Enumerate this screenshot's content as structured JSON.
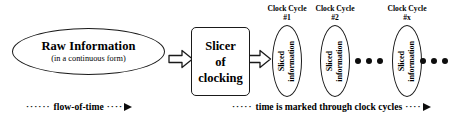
{
  "diagram": {
    "source": {
      "title": "Raw Information",
      "subtitle": "(in a continuous form)"
    },
    "slicer": {
      "line1": "Slicer",
      "line2": "of",
      "line3": "clocking"
    },
    "arrows": {
      "arrow_1_name": "raw-to-slicer",
      "arrow_2_name": "slicer-to-sliced"
    },
    "cycles": [
      {
        "header_title": "Clock Cycle",
        "header_number": "#1",
        "body_line1": "Sliced",
        "body_line2": "information"
      },
      {
        "header_title": "Clock Cycle",
        "header_number": "#2",
        "body_line1": "Sliced",
        "body_line2": "information"
      },
      {
        "header_title": "Clock Cycle",
        "header_number": "#x",
        "body_line1": "Sliced",
        "body_line2": "information"
      }
    ],
    "ellipsis": {
      "middle": "• • •",
      "trailing": "• • •"
    },
    "captions": {
      "flow": {
        "lead": "······",
        "label": "flow-of-time",
        "trail": "····"
      },
      "cycles": {
        "lead": "·····",
        "label": "time is marked through clock cycles",
        "trail": "····"
      }
    },
    "colors": {
      "background": "#ffffff",
      "stroke": "#1a1a1a",
      "text": "#000000",
      "dot": "#0d0d0d"
    }
  }
}
